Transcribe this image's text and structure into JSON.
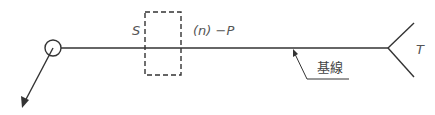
{
  "diagram": {
    "type": "welding-symbol",
    "labels": {
      "s": "S",
      "n_p": "(n) −P",
      "t": "T",
      "reference_line": "基線"
    },
    "colors": {
      "line": "#333333",
      "text": "#555555",
      "background": "#ffffff"
    },
    "elements": {
      "reference_line": {
        "x1": 61,
        "y": 48,
        "x2": 388
      },
      "field_weld_circle": {
        "cx": 53,
        "cy": 48,
        "r": 8
      },
      "arrow": {
        "from": [
          53,
          48
        ],
        "to": [
          22,
          107
        ]
      },
      "dashed_box": {
        "x": 145,
        "y": 12,
        "width": 36,
        "height": 63
      },
      "tail_fork": {
        "vertex": [
          388,
          48
        ],
        "top": [
          414,
          23
        ],
        "bottom": [
          414,
          77
        ]
      },
      "leader": {
        "tip": [
          293,
          50
        ],
        "bend": [
          307,
          79
        ],
        "end": [
          349,
          79
        ]
      }
    }
  }
}
